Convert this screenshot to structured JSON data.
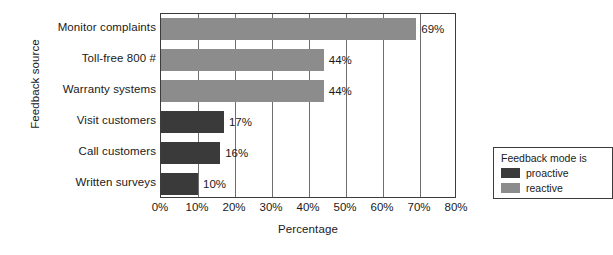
{
  "chart_data": {
    "type": "bar",
    "orientation": "horizontal",
    "title": "",
    "xlabel": "Percentage",
    "ylabel": "Feedback source",
    "categories": [
      "Monitor complaints",
      "Toll-free 800 #",
      "Warranty systems",
      "Visit customers",
      "Call customers",
      "Written surveys"
    ],
    "values": [
      69,
      44,
      44,
      17,
      16,
      10
    ],
    "value_labels": [
      "69%",
      "44%",
      "44%",
      "17%",
      "16%",
      "10%"
    ],
    "groups": [
      "reactive",
      "reactive",
      "reactive",
      "proactive",
      "proactive",
      "proactive"
    ],
    "xlim": [
      0,
      80
    ],
    "xticks": [
      0,
      10,
      20,
      30,
      40,
      50,
      60,
      70,
      80
    ],
    "xtick_labels": [
      "0%",
      "10%",
      "20%",
      "30%",
      "40%",
      "50%",
      "60%",
      "70%",
      "80%"
    ],
    "grid": true,
    "grid_axis": "x",
    "legend": {
      "title": "Feedback mode is",
      "position": "inside-lower-right",
      "entries": [
        {
          "label": "proactive",
          "color": "#3a3a3a"
        },
        {
          "label": "reactive",
          "color": "#8c8c8c"
        }
      ]
    },
    "colors": {
      "proactive": "#3a3a3a",
      "reactive": "#8c8c8c",
      "axis": "#3c3c3c",
      "grid": "#6e6e6e",
      "background": "#ffffff",
      "text": "#1a1a1a"
    }
  }
}
